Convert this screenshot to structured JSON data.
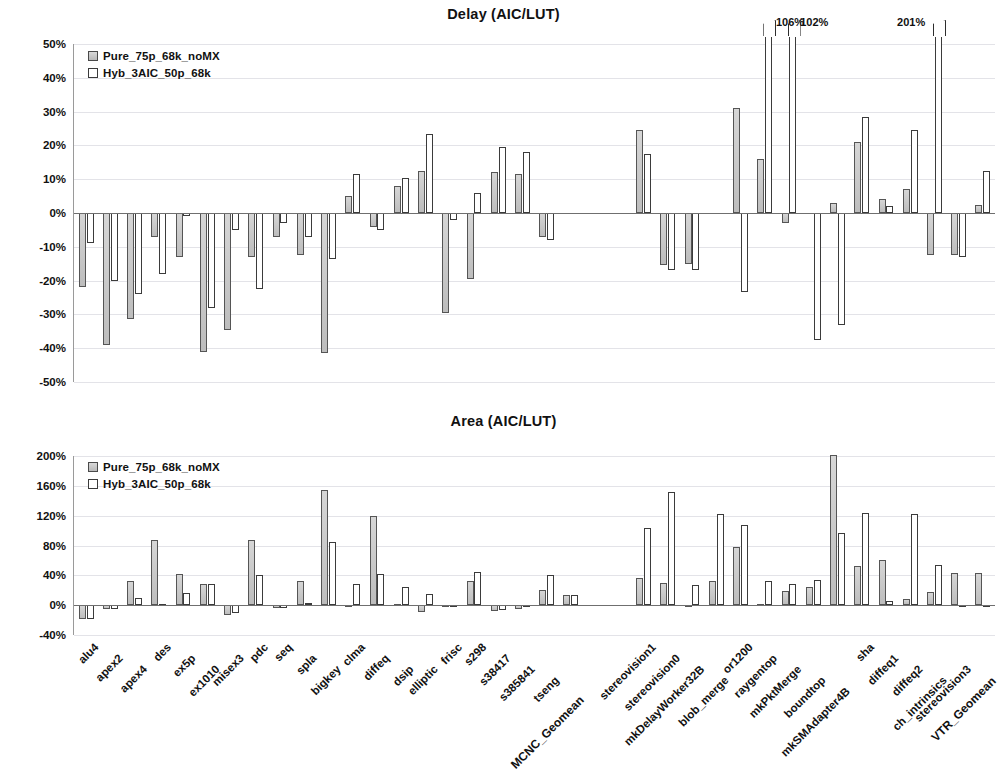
{
  "legend": {
    "series": [
      {
        "name": "Pure_75p_68k_noMX",
        "style": "filled-gray"
      },
      {
        "name": "Hyb_3AIC_50p_68k",
        "style": "hollow-white"
      }
    ]
  },
  "axis": {
    "delay_ticks": [
      "50%",
      "40%",
      "30%",
      "20%",
      "10%",
      "0%",
      "-10%",
      "-20%",
      "-30%",
      "-40%",
      "-50%"
    ],
    "area_ticks": [
      "200%",
      "160%",
      "120%",
      "80%",
      "40%",
      "0%",
      "-40%"
    ]
  },
  "categories": [
    "alu4",
    "apex2",
    "apex4",
    "des",
    "ex5p",
    "ex1010",
    "misex3",
    "pdc",
    "seq",
    "spla",
    "bigkey",
    "clma",
    "diffeq",
    "dsip",
    "elliptic",
    "frisc",
    "s298",
    "s38417",
    "s385841",
    "tseng",
    "MCNC_Geomean",
    "",
    "",
    "stereovision1",
    "stereovision0",
    "mkDelayWorker32B",
    "blob_merge",
    "or1200",
    "raygentop",
    "mkPktMerge",
    "boundtop",
    "mkSMAdapter4B",
    "sha",
    "diffeq1",
    "diffeq2",
    "ch_intrinsics",
    "stereovision3",
    "VTR_Geomean"
  ],
  "overflow_annotations": {
    "delay": [
      {
        "category": "mkPktMerge",
        "label": "106%"
      },
      {
        "category": "boundtop",
        "label": "102%"
      },
      {
        "category": "diffeq2",
        "label": "201%"
      }
    ]
  },
  "chart_data": [
    {
      "type": "bar",
      "title": "Delay (AIC/LUT)",
      "xlabel": "",
      "ylabel": "",
      "ylim": [
        -50,
        50
      ],
      "ytick_step": 10,
      "grid": true,
      "legend_position": "top-left",
      "units": "percent",
      "categories": [
        "alu4",
        "apex2",
        "apex4",
        "des",
        "ex5p",
        "ex1010",
        "misex3",
        "pdc",
        "seq",
        "spla",
        "bigkey",
        "clma",
        "diffeq",
        "dsip",
        "elliptic",
        "frisc",
        "s298",
        "s38417",
        "s385841",
        "tseng",
        "MCNC_Geomean",
        "",
        "",
        "stereovision1",
        "stereovision0",
        "mkDelayWorker32B",
        "blob_merge",
        "or1200",
        "raygentop",
        "mkPktMerge",
        "boundtop",
        "mkSMAdapter4B",
        "sha",
        "diffeq1",
        "diffeq2",
        "ch_intrinsics",
        "stereovision3",
        "VTR_Geomean"
      ],
      "series": [
        {
          "name": "Pure_75p_68k_noMX",
          "values": [
            -22,
            -39,
            -31.5,
            -7,
            -13,
            -41,
            -34.5,
            -13,
            -7,
            -12.5,
            -41.5,
            5,
            -4,
            8,
            12.5,
            -29.5,
            -19.5,
            12,
            11.5,
            -7,
            null,
            null,
            null,
            24.5,
            -15.5,
            -15,
            null,
            31,
            16,
            -3,
            null,
            3,
            21,
            4,
            7,
            -12.5,
            -12.5,
            2.5
          ]
        },
        {
          "name": "Hyb_3AIC_50p_68k",
          "values": [
            -9,
            -20,
            -24,
            -18,
            -1,
            -28,
            -5,
            -22.5,
            -3,
            -7,
            -13.5,
            11.5,
            -5,
            10.5,
            23.5,
            -2,
            6,
            19.5,
            18,
            -8,
            null,
            null,
            null,
            17.5,
            -17,
            -17,
            null,
            -23.5,
            106,
            102,
            -37.5,
            -33,
            28.5,
            2,
            24.5,
            201,
            -13,
            12.5
          ]
        }
      ]
    },
    {
      "type": "bar",
      "title": "Area (AIC/LUT)",
      "xlabel": "",
      "ylabel": "",
      "ylim": [
        -40,
        200
      ],
      "ytick_step": 40,
      "grid": true,
      "legend_position": "top-left",
      "units": "percent",
      "categories": [
        "alu4",
        "apex2",
        "apex4",
        "des",
        "ex5p",
        "ex1010",
        "misex3",
        "pdc",
        "seq",
        "spla",
        "bigkey",
        "clma",
        "diffeq",
        "dsip",
        "elliptic",
        "frisc",
        "s298",
        "s38417",
        "s385841",
        "tseng",
        "MCNC_Geomean",
        "",
        "",
        "stereovision1",
        "stereovision0",
        "mkDelayWorker32B",
        "blob_merge",
        "or1200",
        "raygentop",
        "mkPktMerge",
        "boundtop",
        "mkSMAdapter4B",
        "sha",
        "diffeq1",
        "diffeq2",
        "ch_intrinsics",
        "stereovision3",
        "VTR_Geomean"
      ],
      "series": [
        {
          "name": "Pure_75p_68k_noMX",
          "values": [
            -18,
            -5,
            32,
            88,
            42,
            28,
            -13,
            88,
            -4,
            32,
            155,
            -2,
            119,
            1,
            -9,
            -3,
            33,
            -8,
            -5,
            21,
            14,
            null,
            null,
            36,
            30,
            -2,
            33,
            78,
            2,
            19,
            25,
            201,
            52,
            60,
            8,
            17,
            43,
            43
          ]
        },
        {
          "name": "Hyb_3AIC_50p_68k",
          "values": [
            -18,
            -5,
            10,
            1,
            16,
            29,
            -10,
            41,
            -4,
            3,
            85,
            28,
            42,
            25,
            15,
            -1,
            44,
            -6,
            -2,
            40,
            13,
            null,
            null,
            103,
            152,
            27,
            122,
            107,
            33,
            29,
            34,
            97,
            123,
            6,
            122,
            54,
            0,
            0
          ]
        }
      ]
    }
  ]
}
